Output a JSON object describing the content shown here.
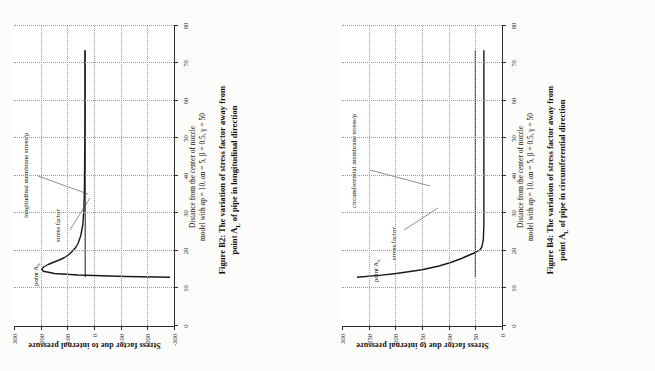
{
  "figures": [
    {
      "id": "B2",
      "axis": {
        "ylabel": "Stress factor due to internal pressure",
        "xlabel": "Distance from the center of nozzle",
        "model_line": "model with αp = 10, αn = 5, β = 0.5, γ = 50",
        "xticks": [
          0,
          10,
          20,
          30,
          40,
          50,
          60,
          70,
          80
        ],
        "yticks": [
          300,
          200,
          100,
          0,
          -100,
          -200,
          -300
        ],
        "xlim": [
          0,
          80
        ],
        "ylim": [
          -300,
          300
        ]
      },
      "caption_line1": "Figure B2: The variation of stress factor away from",
      "caption_line2": "point A",
      "caption_sub": "L",
      "caption_line3": " of pipe in longitudinal direction",
      "annotations": [
        {
          "name": "point-al",
          "text": "point A",
          "sub": "L"
        },
        {
          "name": "stress-factor",
          "text": "stress factor"
        },
        {
          "name": "membrane-stress",
          "text": "longitudinal membrane stress/p"
        }
      ],
      "chart_data": {
        "type": "line",
        "title": "Figure B2: The variation of stress factor away from point A_L of pipe in longitudinal direction",
        "xlabel": "Distance from the center of nozzle",
        "ylabel": "Stress factor due to internal pressure",
        "xlim": [
          0,
          80
        ],
        "ylim": [
          -300,
          300
        ],
        "grid": true,
        "legend": "annotated-inline",
        "series": [
          {
            "name": "stress factor",
            "x": [
              13.0,
              13.2,
              13.6,
              14.0,
              14.6,
              15.2,
              15.8,
              16.4,
              17.0,
              17.6,
              18.2,
              19.0,
              20.0,
              21.0,
              22.0,
              24.0,
              27.0,
              31.0,
              36.0,
              44.0,
              55.0,
              66.0,
              73.5
            ],
            "y": [
              -285,
              -120,
              60,
              148,
              190,
              196,
              188,
              172,
              152,
              130,
              112,
              95,
              80,
              68,
              60,
              50,
              42,
              38,
              36,
              35,
              34,
              34,
              34
            ]
          },
          {
            "name": "longitudinal membrane stress/p",
            "x": [
              13.0,
              20.0,
              30.0,
              40.0,
              50.0,
              60.0,
              70.0,
              73.5
            ],
            "y": [
              33,
              33,
              33,
              33,
              33,
              33,
              33,
              33
            ]
          }
        ],
        "notes": "Stress factor plunges to about -290 at the nozzle edge (x≈13), peaks near +195 around x≈15.5, then decays asymptotically to the membrane value ≈33."
      }
    },
    {
      "id": "B4",
      "axis": {
        "ylabel": "Stress factor due to internal pressure",
        "xlabel": "Distance from the center of nozzle",
        "model_line": "model with αp = 10, αn = 5, β = 0.5, γ = 50",
        "xticks": [
          0,
          10,
          20,
          30,
          40,
          50,
          60,
          70,
          80
        ],
        "yticks": [
          300,
          250,
          200,
          150,
          100,
          50,
          0
        ],
        "xlim": [
          0,
          80
        ],
        "ylim": [
          0,
          300
        ]
      },
      "caption_line1": "Figure B4: The variation of stress factor away from",
      "caption_line2": "point A",
      "caption_sub": "L",
      "caption_line3": " of pipe in circumferential direction",
      "annotations": [
        {
          "name": "point-al",
          "text": "point A",
          "sub": "L"
        },
        {
          "name": "stress-factor",
          "text": "stress factor"
        },
        {
          "name": "membrane-stress",
          "text": "circumferential membrane stress/p"
        }
      ],
      "chart_data": {
        "type": "line",
        "title": "Figure B4: The variation of stress factor away from point A_L of pipe in circumferential direction",
        "xlabel": "Distance from the center of nozzle",
        "ylabel": "Stress factor due to internal pressure",
        "xlim": [
          0,
          80
        ],
        "ylim": [
          0,
          300
        ],
        "grid": true,
        "legend": "annotated-inline",
        "series": [
          {
            "name": "stress factor",
            "x": [
              13.0,
              13.5,
              14.0,
              15.0,
              16.0,
              17.0,
              18.0,
              19.0,
              19.6,
              20.2,
              21.0,
              23.0,
              27.0,
              33.0,
              42.0,
              55.0,
              66.0,
              73.5
            ],
            "y": [
              272,
              230,
              198,
              150,
              118,
              95,
              76,
              60,
              50,
              42,
              38,
              35,
              34,
              34,
              34,
              34,
              34,
              34
            ]
          },
          {
            "name": "circumferential membrane stress/p",
            "x": [
              13.0,
              20.0,
              30.0,
              40.0,
              50.0,
              60.0,
              70.0,
              73.5
            ],
            "y": [
              50,
              50,
              50,
              50,
              50,
              50,
              50,
              50
            ]
          }
        ],
        "notes": "Stress factor starts near 272 at the nozzle edge (x≈13) and falls steeply, crossing the constant circumferential membrane level (≈50) near x≈20, flattening to ≈34 thereafter."
      }
    }
  ]
}
